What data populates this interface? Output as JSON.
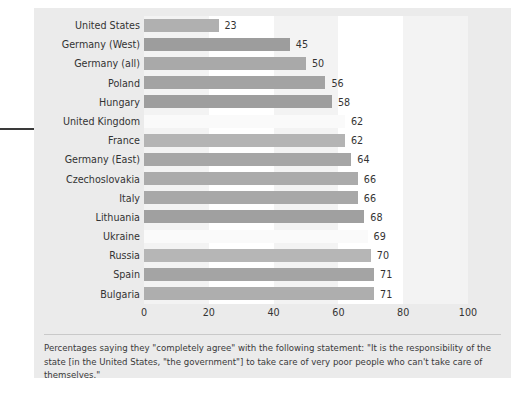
{
  "chart_data": {
    "type": "bar",
    "orientation": "horizontal",
    "title": "",
    "xlabel": "",
    "ylabel": "",
    "xlim": [
      0,
      100
    ],
    "xticks": [
      0,
      20,
      40,
      60,
      80,
      100
    ],
    "xtick_labels": [
      "0",
      "20",
      "40",
      "60",
      "80",
      "100"
    ],
    "grid": false,
    "legend": false,
    "categories": [
      "United States",
      "Germany (West)",
      "Germany (all)",
      "Poland",
      "Hungary",
      "United Kingdom",
      "France",
      "Germany (East)",
      "Czechoslovakia",
      "Italy",
      "Lithuania",
      "Ukraine",
      "Russia",
      "Spain",
      "Bulgaria"
    ],
    "values": [
      23,
      45,
      50,
      56,
      58,
      62,
      62,
      64,
      66,
      66,
      68,
      69,
      70,
      71,
      71
    ],
    "value_labels": [
      "23",
      "45",
      "50",
      "56",
      "58",
      "62",
      "62",
      "64",
      "66",
      "66",
      "68",
      "69",
      "70",
      "71",
      "71"
    ],
    "bar_colors": [
      "#b0b0b0",
      "#9d9d9d",
      "#a9a9a9",
      "#a3a3a3",
      "#9e9e9e",
      "#fafafa",
      "#b4b4b4",
      "#a6a6a6",
      "#ababab",
      "#a8a8a8",
      "#a0a0a0",
      "#fafafa",
      "#b6b6b6",
      "#a4a4a4",
      "#aeaeae"
    ]
  },
  "caption": {
    "text": "Percentages saying they \"completely agree\" with the following statement: \"It is the responsibility of the state [in the United States, \"the government\"] to take care of very poor people who can't take care of themselves.\""
  },
  "colors": {
    "panel_background": "#ebebeb",
    "plot_background": "#ffffff",
    "band": "#f3f3f3",
    "text": "#333333",
    "rule": "#c9c9c9",
    "left_rule": "#3a3a3a"
  }
}
